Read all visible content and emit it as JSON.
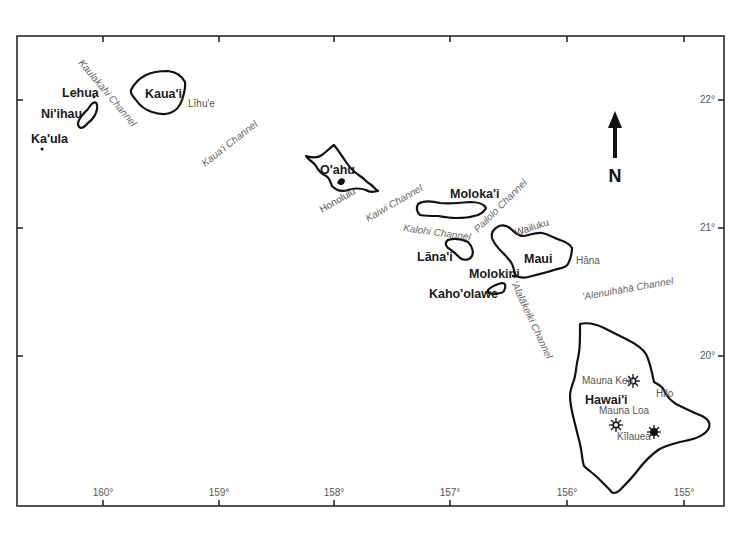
{
  "map": {
    "region": "Hawaiian Islands",
    "frame": {
      "left": 17,
      "top": 36,
      "right": 724,
      "bottom": 506
    },
    "longitude_ticks": [
      {
        "label": "160°",
        "x": 103
      },
      {
        "label": "159°",
        "x": 219
      },
      {
        "label": "158°",
        "x": 334
      },
      {
        "label": "157°",
        "x": 450
      },
      {
        "label": "156°",
        "x": 567
      },
      {
        "label": "155°",
        "x": 684
      }
    ],
    "latitude_ticks": [
      {
        "label": "22°",
        "y": 100
      },
      {
        "label": "21°",
        "y": 228
      },
      {
        "label": "20°",
        "y": 356
      }
    ],
    "north_arrow": {
      "label": "N"
    },
    "islands": [
      {
        "id": "kauai",
        "label": "Kaua'i"
      },
      {
        "id": "niihau",
        "label": "Ni'ihau"
      },
      {
        "id": "lehua",
        "label": "Lehua"
      },
      {
        "id": "kaula",
        "label": "Ka'ula"
      },
      {
        "id": "oahu",
        "label": "O'ahu"
      },
      {
        "id": "molokai",
        "label": "Moloka'i"
      },
      {
        "id": "lanai",
        "label": "Lāna'i"
      },
      {
        "id": "maui",
        "label": "Maui"
      },
      {
        "id": "molokini",
        "label": "Molokini"
      },
      {
        "id": "kahoolawe",
        "label": "Kaho'olawe"
      },
      {
        "id": "hawaii",
        "label": "Hawai'i"
      }
    ],
    "towns": [
      {
        "id": "lihue",
        "label": "Līhu'e"
      },
      {
        "id": "honolulu",
        "label": "Honolulu"
      },
      {
        "id": "wailuku",
        "label": "Wailuku"
      },
      {
        "id": "hana",
        "label": "Hāna"
      },
      {
        "id": "hilo",
        "label": "Hilo"
      }
    ],
    "volcanoes": [
      {
        "id": "mauna-kea",
        "label": "Mauna Kea"
      },
      {
        "id": "mauna-loa",
        "label": "Mauna Loa"
      },
      {
        "id": "kilauea",
        "label": "Kīlauea"
      }
    ],
    "channels": [
      {
        "id": "kaulakahi",
        "label": "Kaulakahi Channel"
      },
      {
        "id": "kauai",
        "label": "Kaua'i Channel"
      },
      {
        "id": "kaiwi",
        "label": "Kaiwi Channel"
      },
      {
        "id": "kalohi",
        "label": "Kalohi Channel"
      },
      {
        "id": "pailolo",
        "label": "Pailolo Channel"
      },
      {
        "id": "alalakeiki",
        "label": "'Alalākeiki Channel"
      },
      {
        "id": "alenuihaha",
        "label": "'Alenuihāhā Channel"
      }
    ]
  }
}
